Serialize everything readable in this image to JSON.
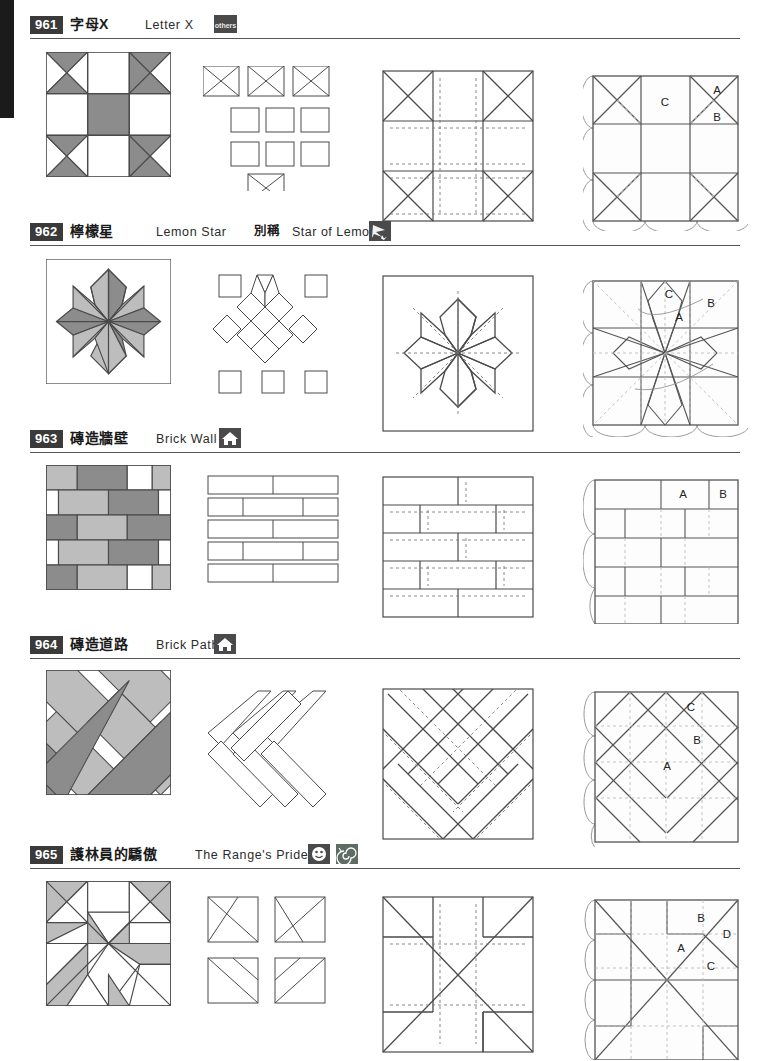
{
  "page": {
    "edge_tab_color": "#1b1b1b",
    "rule_color": "#555555",
    "badge_bg": "#4a4a4a",
    "fill_dark": "#8c8c8c",
    "fill_light": "#bdbdbd",
    "fill_white": "#ffffff",
    "stroke": "#4a4a4a"
  },
  "blocks": [
    {
      "number": "961",
      "name_cn": "字母X",
      "name_en": "Letter X",
      "alt_label": "",
      "alt_name": "",
      "badges": [
        {
          "icon": "others-badge-icon",
          "text": "others"
        }
      ],
      "letters": [
        "A",
        "B",
        "C"
      ]
    },
    {
      "number": "962",
      "name_cn": "檸檬星",
      "name_en": "Lemon Star",
      "alt_label": "別稱",
      "alt_name": "Star of Lemoyne",
      "badges": [
        {
          "icon": "star-badge-icon",
          "text": ""
        }
      ],
      "letters": [
        "A",
        "B",
        "C"
      ]
    },
    {
      "number": "963",
      "name_cn": "磚造牆壁",
      "name_en": "Brick Wall",
      "alt_label": "",
      "alt_name": "",
      "badges": [
        {
          "icon": "house-badge-icon",
          "text": ""
        }
      ],
      "letters": [
        "A",
        "B"
      ]
    },
    {
      "number": "964",
      "name_cn": "磚造道路",
      "name_en": "Brick Path",
      "alt_label": "",
      "alt_name": "",
      "badges": [
        {
          "icon": "house-badge-icon",
          "text": ""
        }
      ],
      "letters": [
        "A",
        "B",
        "C"
      ]
    },
    {
      "number": "965",
      "name_cn": "護林員的驕傲",
      "name_en": "The Range's Pride",
      "alt_label": "",
      "alt_name": "",
      "badges": [
        {
          "icon": "smiley-badge-icon",
          "text": ""
        },
        {
          "icon": "spiral-badge-icon",
          "text": ""
        }
      ],
      "letters": [
        "A",
        "B",
        "C",
        "D"
      ]
    }
  ]
}
